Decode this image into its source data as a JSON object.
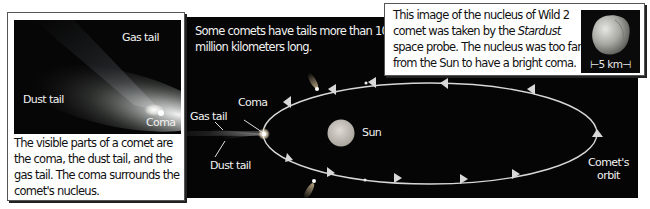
{
  "photo_panel": {
    "labels": {
      "gas_tail": "Gas tail",
      "dust_tail": "Dust tail",
      "coma": "Coma"
    },
    "caption": "The visible parts of a comet are the coma, the dust tail, and the gas tail. The coma surrounds the comet's nucleus."
  },
  "orbit_diagram": {
    "note": "Some comets have tails more than 100 million kilometers long.",
    "labels": {
      "coma": "Coma",
      "gas_tail": "Gas tail",
      "dust_tail": "Dust tail",
      "sun": "Sun",
      "orbit_line1": "Comet's",
      "orbit_line2": "orbit"
    },
    "colors": {
      "background": "#050505",
      "orbit": "#d8d8d8",
      "sun": "#c9c4bd"
    }
  },
  "nucleus_panel": {
    "caption_before": "This image of the nucleus of Wild 2 comet was taken by the ",
    "caption_italic": "Stardust",
    "caption_after": " space probe. The nucleus was too far from the Sun to have a bright coma.",
    "scale_label": "⊢5 km⊣"
  }
}
